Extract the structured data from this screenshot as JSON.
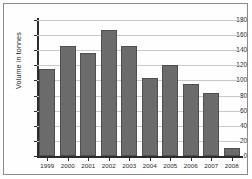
{
  "chart_data": {
    "type": "bar",
    "title": "",
    "xlabel": "",
    "ylabel": "Volume in tonnes",
    "categories": [
      "1999",
      "2000",
      "2001",
      "2002",
      "2003",
      "2004",
      "2005",
      "2006",
      "2007",
      "2008"
    ],
    "values": [
      115,
      145,
      136,
      167,
      146,
      103,
      121,
      95,
      83,
      11
    ],
    "ylim": [
      0,
      180
    ],
    "ytick_labels": [
      "0",
      "20",
      "40",
      "60",
      "80",
      "100",
      "120",
      "140",
      "160",
      "180"
    ],
    "ytick_values": [
      0,
      20,
      40,
      60,
      80,
      100,
      120,
      140,
      160,
      180
    ],
    "grid": true,
    "legend": "none",
    "bar_color": "#6b6b6b",
    "bar_border_color": "#4f4f4f",
    "gridline_color": "#c9c9c9",
    "axis_color": "#2b2b2b",
    "background_color": "#ffffff",
    "frame_border_color": "#8a8a8a"
  }
}
